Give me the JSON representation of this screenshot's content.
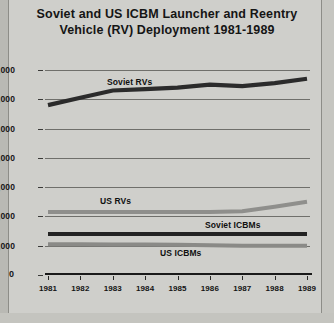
{
  "chart_data": {
    "type": "line",
    "title": "Soviet and US ICBM Launcher and Reentry Vehicle (RV) Deployment 1981-1989",
    "title_line1": "Soviet and US ICBM Launcher and Reentry",
    "title_line2": "Vehicle (RV) Deployment 1981-1989",
    "xlabel": "",
    "ylabel": "",
    "x": [
      "1981",
      "1982",
      "1983",
      "1984",
      "1985",
      "1986",
      "1987",
      "1988",
      "1989"
    ],
    "categories": [
      "1981",
      "1982",
      "1983",
      "1984",
      "1985",
      "1986",
      "1987",
      "1988",
      "1989"
    ],
    "ylim": [
      0,
      7000
    ],
    "ytick_labels": [
      "7,000",
      "6,000",
      "5,000",
      "4,000",
      "3,000",
      "2,000",
      "1,000",
      "0"
    ],
    "ytick_values": [
      7000,
      6000,
      5000,
      4000,
      3000,
      2000,
      1000,
      0
    ],
    "grid": true,
    "legend": "inline-annotations",
    "series": [
      {
        "name": "Soviet RVs",
        "color": "#2b2b2b",
        "values": [
          5800,
          6050,
          6300,
          6350,
          6400,
          6500,
          6450,
          6550,
          6700
        ]
      },
      {
        "name": "US RVs",
        "color": "#8f8f8c",
        "values": [
          2150,
          2150,
          2150,
          2150,
          2150,
          2150,
          2180,
          2330,
          2500
        ]
      },
      {
        "name": "Soviet ICBMs",
        "color": "#232323",
        "values": [
          1400,
          1400,
          1400,
          1400,
          1400,
          1400,
          1400,
          1400,
          1400
        ]
      },
      {
        "name": "US ICBMs",
        "color": "#8a8a87",
        "values": [
          1053,
          1050,
          1045,
          1040,
          1030,
          1020,
          1000,
          1000,
          1000
        ]
      }
    ],
    "annotations": [
      {
        "text": "Soviet RVs",
        "series": "Soviet RVs"
      },
      {
        "text": "US RVs",
        "series": "US RVs"
      },
      {
        "text": "Soviet ICBMs",
        "series": "Soviet ICBMs"
      },
      {
        "text": "US ICBMs",
        "series": "US ICBMs"
      }
    ],
    "colors": {
      "background": "#cfcfcb",
      "gridline": "#6f6f6b",
      "axis": "#1a1a1a",
      "text": "#141414"
    }
  }
}
